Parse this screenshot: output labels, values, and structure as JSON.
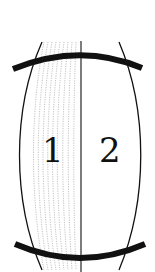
{
  "diagram": {
    "regions": [
      {
        "label": "1",
        "shaded": true
      },
      {
        "label": "2",
        "shaded": false
      }
    ],
    "colors": {
      "stroke": "#111111",
      "hatch": "#9a9a9a",
      "background": "#ffffff"
    }
  }
}
